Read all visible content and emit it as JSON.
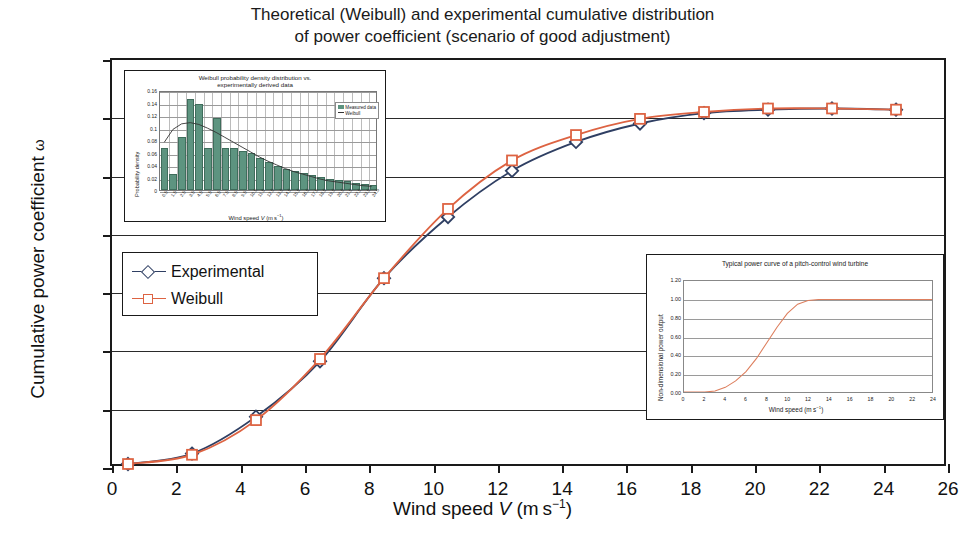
{
  "title": {
    "line1": "Theoretical (Weibull) and experimental cumulative distribution",
    "line2": "of power coefficient (scenario of good adjustment)"
  },
  "colors": {
    "experimental": "#2f3f63",
    "weibull": "#dd6342",
    "histogram_bar": "#5d9480",
    "axis": "#1a1a1a",
    "grid": "#2a2a2a"
  },
  "legend": {
    "items": [
      {
        "label": "Experimental",
        "marker": "diamond",
        "color": "#2f3f63"
      },
      {
        "label": "Weibull",
        "marker": "square",
        "color": "#dd6342"
      }
    ]
  },
  "chart_data": {
    "type": "line",
    "title": "Theoretical (Weibull) and experimental cumulative distribution of power coefficient (scenario of good adjustment)",
    "xlabel": "Wind speed V (m s-1)",
    "ylabel": "Cumulative power coefficient ω",
    "xlim": [
      0,
      26
    ],
    "ylim": [
      0,
      0.35
    ],
    "xticks": [
      0,
      2,
      4,
      6,
      8,
      10,
      12,
      14,
      16,
      18,
      20,
      22,
      24,
      26
    ],
    "yticks": [
      "0.00",
      "0.05",
      "0.10",
      "0.15",
      "0.20",
      "0.25",
      "0.30",
      "0.35"
    ],
    "grid": "horizontal",
    "legend_position": "center-left",
    "x": [
      0.5,
      2.5,
      4.5,
      6.5,
      8.5,
      10.5,
      12.5,
      14.5,
      16.5,
      18.5,
      20.5,
      22.5,
      24.5
    ],
    "series": [
      {
        "name": "Experimental",
        "marker": "diamond",
        "color": "#2f3f63",
        "values": [
          0.0,
          0.009,
          0.041,
          0.089,
          0.161,
          0.214,
          0.254,
          0.279,
          0.295,
          0.304,
          0.307,
          0.308,
          0.307
        ]
      },
      {
        "name": "Weibull",
        "marker": "square",
        "color": "#dd6342",
        "values": [
          0.0,
          0.008,
          0.038,
          0.091,
          0.161,
          0.221,
          0.263,
          0.285,
          0.299,
          0.305,
          0.308,
          0.308,
          0.307
        ]
      }
    ]
  },
  "inset_histogram": {
    "title_line1": "Weibull probability density distribution vs.",
    "title_line2": "experimentally derived data",
    "ylabel": "Probability density",
    "xlabel": "Wind speed V (m s-1)",
    "yticks": [
      "0.16",
      "0.14",
      "0.12",
      "0.1",
      "0.08",
      "0.06",
      "0.04",
      "0.02",
      "0"
    ],
    "ylim": [
      0,
      0.16
    ],
    "xticks": [
      "0.5",
      "1.5",
      "2.5",
      "3.5",
      "4.5",
      "5.5",
      "6.5",
      "7.5",
      "8.5",
      "9.5",
      "10.5",
      "11.5",
      "12.5",
      "13.5",
      "14.5",
      "15.5",
      "16.5",
      "17.5",
      "18.5",
      "19.5",
      "20.5",
      "21.5",
      "22.5",
      "23.5",
      "24.5"
    ],
    "legend": [
      {
        "label": "Measured data",
        "type": "bar",
        "color": "#5d9480"
      },
      {
        "label": "Weibull",
        "type": "line",
        "color": "#333333"
      }
    ],
    "chart_data": {
      "type": "bar",
      "categories": [
        "0.5",
        "1.5",
        "2.5",
        "3.5",
        "4.5",
        "5.5",
        "6.5",
        "7.5",
        "8.5",
        "9.5",
        "10.5",
        "11.5",
        "12.5",
        "13.5",
        "14.5",
        "15.5",
        "16.5",
        "17.5",
        "18.5",
        "19.5",
        "20.5",
        "21.5",
        "22.5",
        "23.5",
        "24.5"
      ],
      "values": [
        0.068,
        0.025,
        0.085,
        0.145,
        0.138,
        0.068,
        0.115,
        0.068,
        0.068,
        0.062,
        0.06,
        0.052,
        0.045,
        0.038,
        0.034,
        0.03,
        0.027,
        0.024,
        0.021,
        0.018,
        0.016,
        0.014,
        0.012,
        0.01,
        0.008
      ],
      "line_name": "Weibull",
      "line_values": [
        0.078,
        0.099,
        0.108,
        0.11,
        0.107,
        0.101,
        0.094,
        0.086,
        0.078,
        0.07,
        0.062,
        0.054,
        0.047,
        0.041,
        0.035,
        0.03,
        0.026,
        0.022,
        0.018,
        0.015,
        0.013,
        0.011,
        0.009,
        0.007,
        0.006
      ]
    }
  },
  "inset_power": {
    "title": "Typical power curve of a pitch-control wind turbine",
    "ylabel": "Non-dimensional power output",
    "xlabel": "Wind speed (m s-1)",
    "yticks": [
      "1.20",
      "1.00",
      "0.80",
      "0.60",
      "0.40",
      "0.20",
      "0.00"
    ],
    "ylim": [
      0,
      1.2
    ],
    "xticks": [
      0,
      2,
      4,
      6,
      8,
      10,
      12,
      14,
      16,
      18,
      20,
      22,
      24
    ],
    "xlim": [
      0,
      24
    ],
    "chart_data": {
      "type": "line",
      "color": "#dd7f5e",
      "x": [
        0,
        1,
        2,
        3,
        4,
        5,
        6,
        7,
        8,
        9,
        10,
        11,
        12,
        13,
        14,
        16,
        18,
        20,
        22,
        24
      ],
      "values": [
        0.0,
        0.0,
        0.0,
        0.01,
        0.05,
        0.12,
        0.22,
        0.36,
        0.53,
        0.7,
        0.85,
        0.95,
        0.99,
        1.0,
        1.0,
        1.0,
        1.0,
        1.0,
        1.0,
        1.0
      ]
    }
  }
}
